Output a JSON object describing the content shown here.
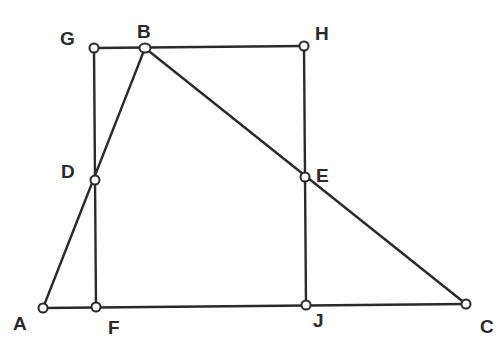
{
  "diagram": {
    "type": "geometry",
    "points": [
      {
        "id": "G",
        "label": "G",
        "x": 94,
        "y": 48,
        "lx": 60,
        "ly": 45
      },
      {
        "id": "B",
        "label": "B",
        "x": 145,
        "y": 48,
        "lx": 137,
        "ly": 38
      },
      {
        "id": "H",
        "label": "H",
        "x": 304,
        "y": 46,
        "lx": 315,
        "ly": 40
      },
      {
        "id": "D",
        "label": "D",
        "x": 95,
        "y": 180,
        "lx": 61,
        "ly": 178
      },
      {
        "id": "E",
        "label": "E",
        "x": 305,
        "y": 177,
        "lx": 316,
        "ly": 182
      },
      {
        "id": "A",
        "label": "A",
        "x": 43,
        "y": 308,
        "lx": 13,
        "ly": 330
      },
      {
        "id": "F",
        "label": "F",
        "x": 96,
        "y": 307,
        "lx": 108,
        "ly": 334
      },
      {
        "id": "J",
        "label": "J",
        "x": 306,
        "y": 305,
        "lx": 313,
        "ly": 327
      },
      {
        "id": "C",
        "label": "C",
        "x": 466,
        "y": 304,
        "lx": 480,
        "ly": 333
      }
    ],
    "segments": [
      [
        "G",
        "H"
      ],
      [
        "G",
        "F"
      ],
      [
        "H",
        "J"
      ],
      [
        "A",
        "C"
      ],
      [
        "A",
        "B"
      ],
      [
        "B",
        "C"
      ]
    ],
    "colors": {
      "stroke": "#2a2a2a",
      "background": "#ffffff"
    }
  }
}
